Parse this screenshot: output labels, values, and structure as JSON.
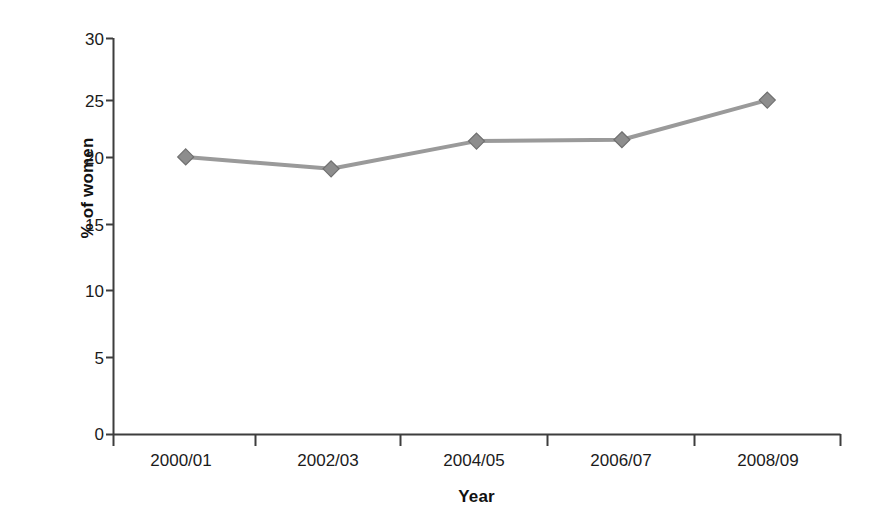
{
  "chart_data": {
    "type": "line",
    "title": "",
    "xlabel": "Year",
    "ylabel": "% of women",
    "categories": [
      "2000/01",
      "2002/03",
      "2004/05",
      "2006/07",
      "2008/09"
    ],
    "values": [
      21.0,
      20.1,
      22.2,
      22.3,
      25.3
    ],
    "series": [
      {
        "name": "% of women",
        "values": [
          21.0,
          20.1,
          22.2,
          22.3,
          25.3
        ]
      }
    ],
    "ylim": [
      0,
      30
    ],
    "yticks": [
      0,
      5,
      10,
      15,
      20,
      25,
      30
    ],
    "ytick_labels": [
      "0",
      "5",
      "10",
      "15",
      "20",
      "25",
      "30"
    ],
    "grid": false,
    "legend": "none",
    "marker": "diamond",
    "colors": {
      "line": "#9a9a9a",
      "marker": "#8a8a8a",
      "marker_edge": "#6f6f6f",
      "axis": "#404040",
      "text": "#1b1b1b",
      "background": "#ffffff"
    }
  },
  "axis": {
    "y_title": "% of women",
    "x_title": "Year"
  }
}
